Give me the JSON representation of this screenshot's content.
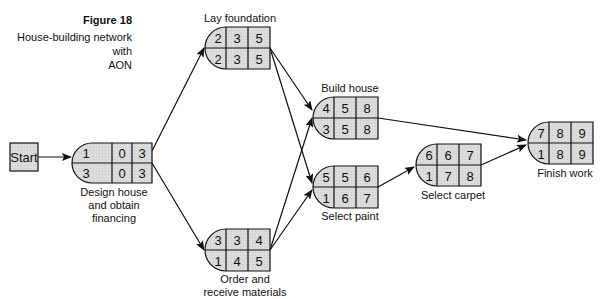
{
  "figure": {
    "number": "Figure 18",
    "title_line1": "House-building network with",
    "title_line2": "AON"
  },
  "start": {
    "label": "Start"
  },
  "nodes": {
    "design": {
      "label_lines": [
        "Design house",
        "and obtain",
        "financing"
      ],
      "top": [
        "1",
        "0",
        "3"
      ],
      "bottom": [
        "3",
        "0",
        "3"
      ]
    },
    "foundation": {
      "label": "Lay foundation",
      "top": [
        "2",
        "3",
        "5"
      ],
      "bottom": [
        "2",
        "3",
        "5"
      ]
    },
    "materials": {
      "label_lines": [
        "Order and",
        "receive materials"
      ],
      "top": [
        "3",
        "3",
        "4"
      ],
      "bottom": [
        "1",
        "4",
        "5"
      ]
    },
    "build": {
      "label": "Build house",
      "top": [
        "4",
        "5",
        "8"
      ],
      "bottom": [
        "3",
        "5",
        "8"
      ]
    },
    "paint": {
      "label": "Select paint",
      "top": [
        "5",
        "5",
        "6"
      ],
      "bottom": [
        "1",
        "6",
        "7"
      ]
    },
    "carpet": {
      "label": "Select carpet",
      "top": [
        "6",
        "6",
        "7"
      ],
      "bottom": [
        "1",
        "7",
        "8"
      ]
    },
    "finish": {
      "label": "Finish work",
      "top": [
        "7",
        "8",
        "9"
      ],
      "bottom": [
        "1",
        "8",
        "9"
      ]
    }
  },
  "edges": [
    [
      "start",
      "design"
    ],
    [
      "design",
      "foundation"
    ],
    [
      "design",
      "materials"
    ],
    [
      "foundation",
      "build"
    ],
    [
      "foundation",
      "paint"
    ],
    [
      "materials",
      "build"
    ],
    [
      "materials",
      "paint"
    ],
    [
      "build",
      "finish"
    ],
    [
      "paint",
      "carpet"
    ],
    [
      "carpet",
      "finish"
    ]
  ],
  "colors": {
    "node_fill": "#d9d9d9",
    "stroke": "#111111"
  }
}
